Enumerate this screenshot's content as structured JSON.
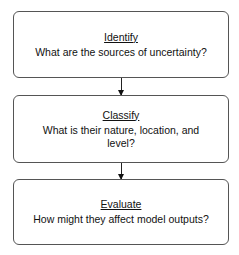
{
  "flowchart": {
    "steps": [
      {
        "title": "Identify",
        "question": "What are the sources of uncertainty?"
      },
      {
        "title": "Classify",
        "question": "What is their nature, location, and level?"
      },
      {
        "title": "Evaluate",
        "question": "How might they affect model outputs?"
      }
    ],
    "colors": {
      "border": "#555555",
      "arrow": "#111111",
      "text": "#111111",
      "background": "#ffffff"
    }
  }
}
